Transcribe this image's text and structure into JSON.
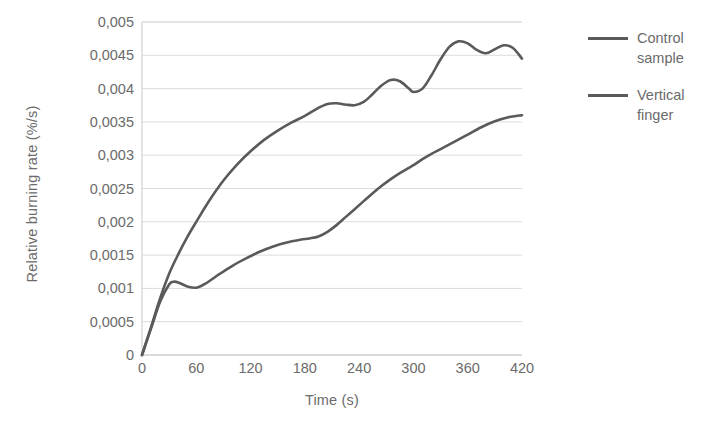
{
  "chart_data": {
    "type": "line",
    "title": "",
    "xlabel": "Time (s)",
    "ylabel": "Relative burning rate (%/s)",
    "xlim": [
      0,
      420
    ],
    "ylim": [
      0,
      0.005
    ],
    "xticks": [
      0,
      60,
      120,
      180,
      240,
      300,
      360,
      420
    ],
    "xtick_labels": [
      "0",
      "60",
      "120",
      "180",
      "240",
      "300",
      "360",
      "420"
    ],
    "yticks": [
      0,
      0.0005,
      0.001,
      0.0015,
      0.002,
      0.0025,
      0.003,
      0.0035,
      0.004,
      0.0045,
      0.005
    ],
    "ytick_labels": [
      "0",
      "0,0005",
      "0,001",
      "0,0015",
      "0,002",
      "0,0025",
      "0,003",
      "0,0035",
      "0,004",
      "0,0045",
      "0,005"
    ],
    "grid": true,
    "grid_axis": "y",
    "grid_color": "#dcdcdc",
    "legend_position": "right",
    "line_color": "#5a5a5c",
    "line_width": 2.6,
    "series": [
      {
        "name": "Control sample",
        "color": "#5a5a5c",
        "x": [
          0,
          10,
          20,
          30,
          40,
          50,
          60,
          75,
          90,
          105,
          120,
          135,
          150,
          165,
          180,
          195,
          205,
          215,
          225,
          235,
          245,
          255,
          265,
          275,
          285,
          295,
          300,
          310,
          320,
          330,
          340,
          350,
          360,
          370,
          380,
          390,
          400,
          410,
          420
        ],
        "y": [
          0.0,
          0.00042,
          0.00085,
          0.00122,
          0.00151,
          0.00177,
          0.002,
          0.00233,
          0.00262,
          0.00286,
          0.00306,
          0.00323,
          0.00337,
          0.00349,
          0.00359,
          0.00371,
          0.00377,
          0.00378,
          0.00376,
          0.00375,
          0.0038,
          0.00392,
          0.00405,
          0.00413,
          0.00411,
          0.004,
          0.00395,
          0.004,
          0.0042,
          0.00444,
          0.00463,
          0.00471,
          0.00468,
          0.00458,
          0.00453,
          0.00459,
          0.00465,
          0.00461,
          0.00445
        ]
      },
      {
        "name": "Vertical finger",
        "color": "#5a5a5c",
        "x": [
          0,
          10,
          20,
          30,
          35,
          40,
          50,
          60,
          70,
          85,
          100,
          115,
          130,
          145,
          160,
          175,
          185,
          195,
          205,
          215,
          225,
          235,
          245,
          255,
          265,
          275,
          285,
          295,
          300,
          310,
          320,
          330,
          345,
          360,
          375,
          390,
          405,
          420
        ],
        "y": [
          0.0,
          0.0004,
          0.0008,
          0.00106,
          0.0011,
          0.00109,
          0.00103,
          0.00101,
          0.00107,
          0.00121,
          0.00134,
          0.00145,
          0.00155,
          0.00163,
          0.00169,
          0.00173,
          0.00175,
          0.00178,
          0.00185,
          0.00195,
          0.00207,
          0.00219,
          0.00231,
          0.00243,
          0.00254,
          0.00264,
          0.00273,
          0.00281,
          0.00285,
          0.00294,
          0.00302,
          0.00309,
          0.0032,
          0.00331,
          0.00342,
          0.00351,
          0.00357,
          0.0036
        ]
      }
    ]
  },
  "legend": {
    "items": [
      {
        "label_line1": "Control",
        "label_line2": "sample"
      },
      {
        "label_line1": "Vertical",
        "label_line2": "finger"
      }
    ]
  }
}
